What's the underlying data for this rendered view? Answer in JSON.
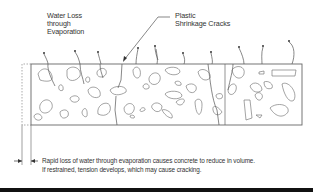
{
  "labels": {
    "water_loss": [
      "Water Loss",
      "through",
      "Evaporation"
    ],
    "cracks": [
      "Plastic",
      "Shrinkage Cracks"
    ]
  },
  "caption": {
    "line1": "Rapid loss of water through evaporation causes concrete to reduce in volume.",
    "line2": "If restrained, tension develops, which may cause cracking."
  }
}
